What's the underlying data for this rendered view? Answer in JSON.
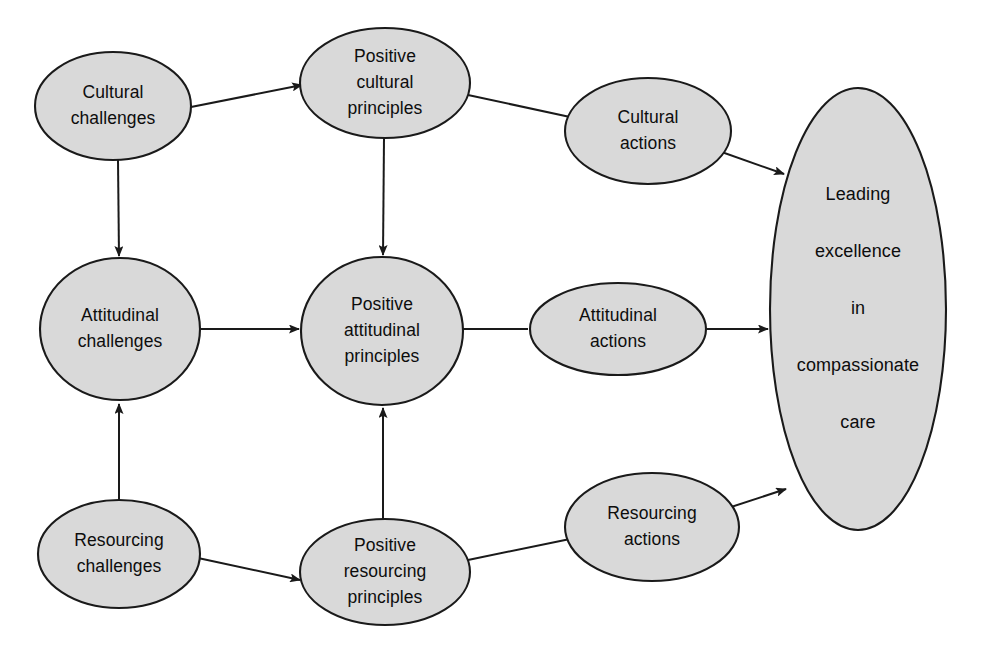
{
  "diagram": {
    "style": {
      "node_fill": "#d9d9d9",
      "node_stroke": "#1a1a1a",
      "background": "#ffffff",
      "text_color": "#0d0d0d"
    },
    "nodes": [
      {
        "id": "cultural-challenges",
        "lines": [
          "Cultural",
          "challenges"
        ],
        "shape": "ellipse",
        "cx": 113,
        "cy": 106,
        "rx": 78,
        "ry": 54
      },
      {
        "id": "positive-cultural-principles",
        "lines": [
          "Positive",
          "cultural",
          "principles"
        ],
        "shape": "ellipse",
        "cx": 385,
        "cy": 83,
        "rx": 85,
        "ry": 55
      },
      {
        "id": "cultural-actions",
        "lines": [
          "Cultural",
          "actions"
        ],
        "shape": "ellipse",
        "cx": 648,
        "cy": 131,
        "rx": 83,
        "ry": 53
      },
      {
        "id": "attitudinal-challenges",
        "lines": [
          "Attitudinal",
          "challenges"
        ],
        "shape": "ellipse",
        "cx": 120,
        "cy": 329,
        "rx": 80,
        "ry": 71
      },
      {
        "id": "positive-attitudinal-principles",
        "lines": [
          "Positive",
          "attitudinal",
          "principles"
        ],
        "shape": "ellipse",
        "cx": 382,
        "cy": 331,
        "rx": 81,
        "ry": 74
      },
      {
        "id": "attitudinal-actions",
        "lines": [
          "Attitudinal",
          "actions"
        ],
        "shape": "ellipse",
        "cx": 618,
        "cy": 329,
        "rx": 88,
        "ry": 46
      },
      {
        "id": "resourcing-challenges",
        "lines": [
          "Resourcing",
          "challenges"
        ],
        "shape": "ellipse",
        "cx": 119,
        "cy": 554,
        "rx": 81,
        "ry": 54
      },
      {
        "id": "positive-resourcing-principles",
        "lines": [
          "Positive",
          "resourcing",
          "principles"
        ],
        "shape": "ellipse",
        "cx": 385,
        "cy": 572,
        "rx": 85,
        "ry": 53
      },
      {
        "id": "resourcing-actions",
        "lines": [
          "Resourcing",
          "actions"
        ],
        "shape": "ellipse",
        "cx": 652,
        "cy": 527,
        "rx": 87,
        "ry": 54
      },
      {
        "id": "leading-excellence-goal",
        "lines": [
          "Leading",
          "excellence",
          "in",
          "compassionate",
          "care"
        ],
        "shape": "ellipse",
        "cx": 858,
        "cy": 309,
        "rx": 88,
        "ry": 221
      }
    ],
    "edges": [
      {
        "id": "cultural-challenges-to-positive-cultural-principles",
        "from": "cultural-challenges",
        "to": "positive-cultural-principles",
        "x1": 186,
        "y1": 108,
        "x2": 302,
        "y2": 85
      },
      {
        "id": "cultural-challenges-to-attitudinal-challenges",
        "from": "cultural-challenges",
        "to": "attitudinal-challenges",
        "x1": 118,
        "y1": 160,
        "x2": 119,
        "y2": 256
      },
      {
        "id": "positive-cultural-principles-to-cultural-actions",
        "from": "positive-cultural-principles",
        "to": "cultural-actions",
        "x1": 468,
        "y1": 95,
        "x2": 570,
        "y2": 117,
        "arrow": false
      },
      {
        "id": "positive-cultural-principles-to-positive-attitudinal-principles",
        "from": "positive-cultural-principles",
        "to": "positive-attitudinal-principles",
        "x1": 384,
        "y1": 138,
        "x2": 383,
        "y2": 255
      },
      {
        "id": "cultural-actions-to-goal",
        "from": "cultural-actions",
        "to": "leading-excellence-goal",
        "x1": 716,
        "y1": 150,
        "x2": 784,
        "y2": 174
      },
      {
        "id": "attitudinal-challenges-to-positive-attitudinal-principles",
        "from": "attitudinal-challenges",
        "to": "positive-attitudinal-principles",
        "x1": 200,
        "y1": 329,
        "x2": 299,
        "y2": 329
      },
      {
        "id": "positive-attitudinal-principles-to-attitudinal-actions",
        "from": "positive-attitudinal-principles",
        "to": "attitudinal-actions",
        "x1": 463,
        "y1": 329,
        "x2": 528,
        "y2": 329,
        "arrow": false
      },
      {
        "id": "attitudinal-actions-to-goal",
        "from": "attitudinal-actions",
        "to": "leading-excellence-goal",
        "x1": 706,
        "y1": 329,
        "x2": 768,
        "y2": 329
      },
      {
        "id": "resourcing-challenges-to-attitudinal-challenges",
        "from": "resourcing-challenges",
        "to": "attitudinal-challenges",
        "x1": 119,
        "y1": 500,
        "x2": 119,
        "y2": 404
      },
      {
        "id": "resourcing-challenges-to-positive-resourcing-principles",
        "from": "resourcing-challenges",
        "to": "positive-resourcing-principles",
        "x1": 198,
        "y1": 558,
        "x2": 300,
        "y2": 580
      },
      {
        "id": "positive-resourcing-principles-to-positive-attitudinal-principles",
        "from": "positive-resourcing-principles",
        "to": "positive-attitudinal-principles",
        "x1": 383,
        "y1": 520,
        "x2": 383,
        "y2": 408
      },
      {
        "id": "positive-resourcing-principles-to-resourcing-actions",
        "from": "positive-resourcing-principles",
        "to": "resourcing-actions",
        "x1": 468,
        "y1": 560,
        "x2": 570,
        "y2": 539,
        "arrow": false
      },
      {
        "id": "resourcing-actions-to-goal",
        "from": "resourcing-actions",
        "to": "leading-excellence-goal",
        "x1": 722,
        "y1": 510,
        "x2": 786,
        "y2": 489
      }
    ]
  }
}
